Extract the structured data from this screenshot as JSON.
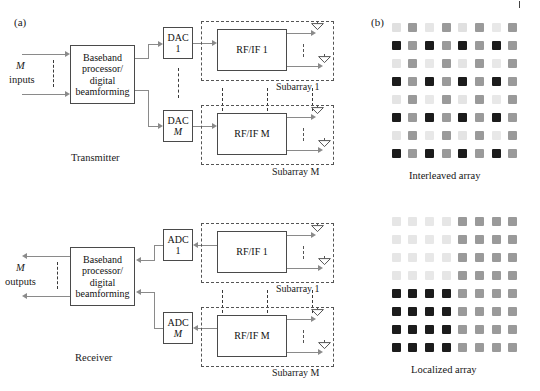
{
  "figure": {
    "panel_a_label": "(a)",
    "panel_b_label": "(b)"
  },
  "transmitter": {
    "section_label": "Transmitter",
    "io_label_line1": "M",
    "io_label_line2": "inputs",
    "baseband_line1": "Baseband",
    "baseband_line2": "processor/",
    "baseband_line3": "digital",
    "baseband_line4": "beamforming",
    "converters": [
      {
        "line1": "DAC",
        "line2": "1"
      },
      {
        "line1": "DAC",
        "line2": "M"
      }
    ],
    "rf_chains": [
      {
        "label": "RF/IF 1",
        "subarray_label": "Subarray 1"
      },
      {
        "label": "RF/IF M",
        "subarray_label": "Subarray M"
      }
    ]
  },
  "receiver": {
    "section_label": "Receiver",
    "io_label_line1": "M",
    "io_label_line2": "outputs",
    "baseband_line1": "Baseband",
    "baseband_line2": "processor/",
    "baseband_line3": "digital",
    "baseband_line4": "beamforming",
    "converters": [
      {
        "line1": "ADC",
        "line2": "1"
      },
      {
        "line1": "ADC",
        "line2": "M"
      }
    ],
    "rf_chains": [
      {
        "label": "RF/IF 1",
        "subarray_label": "Subarray 1"
      },
      {
        "label": "RF/IF M",
        "subarray_label": "Subarray M"
      }
    ]
  },
  "arrays": {
    "interleaved": {
      "caption": "Interleaved array",
      "rows": 8,
      "cols": 8,
      "pattern": [
        [
          "#e0e0e0",
          "#9a9a9a",
          "#e6e6e6",
          "#9a9a9a",
          "#e0e0e0",
          "#9a9a9a",
          "#e8e8e8",
          "#9a9a9a"
        ],
        [
          "#1c1c1c",
          "#9a9a9a",
          "#1c1c1c",
          "#9a9a9a",
          "#1c1c1c",
          "#9a9a9a",
          "#1c1c1c",
          "#9a9a9a"
        ],
        [
          "#e4e4e4",
          "#9a9a9a",
          "#e8e8e8",
          "#9a9a9a",
          "#e4e4e4",
          "#9a9a9a",
          "#e8e8e8",
          "#9a9a9a"
        ],
        [
          "#1c1c1c",
          "#9a9a9a",
          "#1c1c1c",
          "#9a9a9a",
          "#1c1c1c",
          "#9a9a9a",
          "#1c1c1c",
          "#9a9a9a"
        ],
        [
          "#e4e4e4",
          "#9a9a9a",
          "#e8e8e8",
          "#9a9a9a",
          "#e4e4e4",
          "#9a9a9a",
          "#e8e8e8",
          "#9a9a9a"
        ],
        [
          "#1c1c1c",
          "#9a9a9a",
          "#1c1c1c",
          "#9a9a9a",
          "#1c1c1c",
          "#9a9a9a",
          "#1c1c1c",
          "#9a9a9a"
        ],
        [
          "#e4e4e4",
          "#9a9a9a",
          "#e8e8e8",
          "#9a9a9a",
          "#e4e4e4",
          "#9a9a9a",
          "#e8e8e8",
          "#9a9a9a"
        ],
        [
          "#1c1c1c",
          "#9a9a9a",
          "#1c1c1c",
          "#9a9a9a",
          "#1c1c1c",
          "#9a9a9a",
          "#1c1c1c",
          "#9a9a9a"
        ]
      ]
    },
    "localized": {
      "caption": "Localized array",
      "rows": 8,
      "cols": 8,
      "pattern": [
        [
          "#e6e6e6",
          "#e6e6e6",
          "#e8e8e8",
          "#e6e6e6",
          "#9a9a9a",
          "#9a9a9a",
          "#9a9a9a",
          "#9a9a9a"
        ],
        [
          "#e6e6e6",
          "#e6e6e6",
          "#e8e8e8",
          "#e6e6e6",
          "#9a9a9a",
          "#9a9a9a",
          "#9a9a9a",
          "#9a9a9a"
        ],
        [
          "#e6e6e6",
          "#e6e6e6",
          "#e8e8e8",
          "#e6e6e6",
          "#9a9a9a",
          "#9a9a9a",
          "#9a9a9a",
          "#9a9a9a"
        ],
        [
          "#e6e6e6",
          "#e6e6e6",
          "#e8e8e8",
          "#e6e6e6",
          "#9a9a9a",
          "#9a9a9a",
          "#9a9a9a",
          "#9a9a9a"
        ],
        [
          "#1c1c1c",
          "#1c1c1c",
          "#1c1c1c",
          "#1c1c1c",
          "#9a9a9a",
          "#9a9a9a",
          "#9a9a9a",
          "#9a9a9a"
        ],
        [
          "#1c1c1c",
          "#1c1c1c",
          "#1c1c1c",
          "#1c1c1c",
          "#9a9a9a",
          "#9a9a9a",
          "#9a9a9a",
          "#9a9a9a"
        ],
        [
          "#1c1c1c",
          "#1c1c1c",
          "#1c1c1c",
          "#1c1c1c",
          "#9a9a9a",
          "#9a9a9a",
          "#9a9a9a",
          "#9a9a9a"
        ],
        [
          "#1c1c1c",
          "#1c1c1c",
          "#1c1c1c",
          "#1c1c1c",
          "#9a9a9a",
          "#9a9a9a",
          "#9a9a9a",
          "#9a9a9a"
        ]
      ]
    }
  }
}
